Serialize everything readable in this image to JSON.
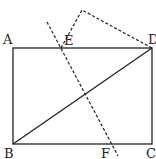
{
  "diagram": {
    "type": "geometry",
    "labels": {
      "A": "A",
      "B": "B",
      "C": "C",
      "D": "D",
      "E": "E",
      "F": "F"
    },
    "points": {
      "A": [
        13,
        48
      ],
      "B": [
        13,
        144
      ],
      "C": [
        152,
        144
      ],
      "D": [
        152,
        48
      ],
      "E": [
        61,
        48
      ],
      "F": [
        110,
        144
      ],
      "P": [
        82,
        10
      ]
    },
    "stroke_color": "#222222"
  }
}
